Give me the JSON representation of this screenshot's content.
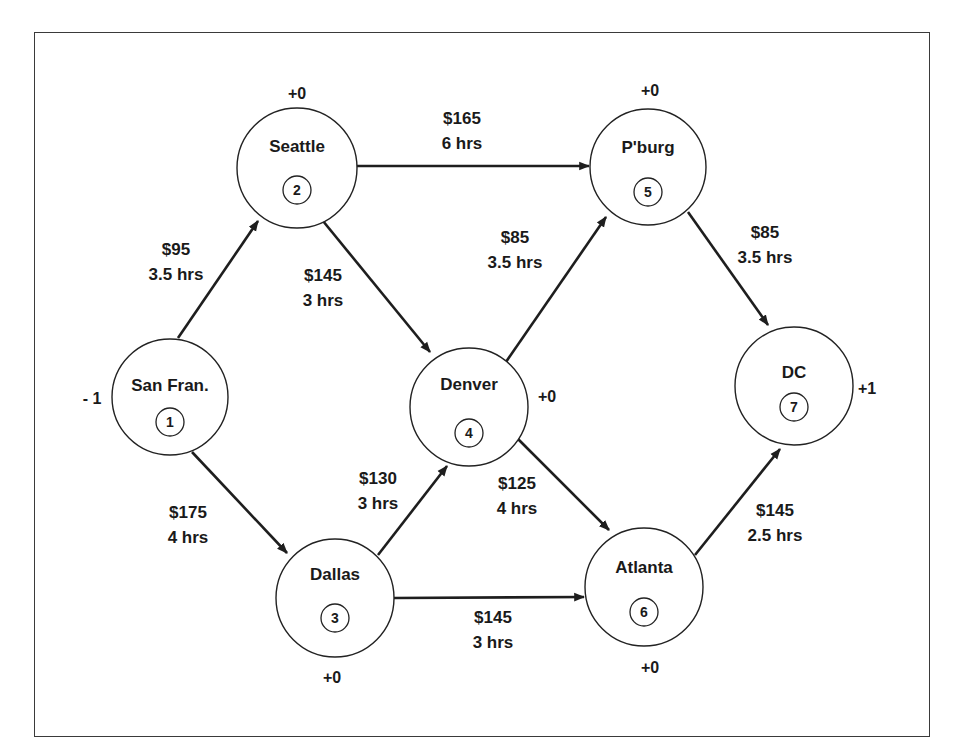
{
  "diagram": {
    "type": "network-flow",
    "nodes": [
      {
        "id": "1",
        "name": "San Fran.",
        "supply": "- 1",
        "cx": 170,
        "cy": 397,
        "r": 58,
        "supply_x": 92,
        "supply_y": 404,
        "name_dy": -12,
        "id_dy": 25
      },
      {
        "id": "2",
        "name": "Seattle",
        "supply": "+0",
        "cx": 297,
        "cy": 168,
        "r": 60,
        "supply_x": 297,
        "supply_y": 99,
        "name_dy": -22,
        "id_dy": 22
      },
      {
        "id": "3",
        "name": "Dallas",
        "supply": "+0",
        "cx": 335,
        "cy": 598,
        "r": 59,
        "supply_x": 332,
        "supply_y": 683,
        "name_dy": -24,
        "id_dy": 20
      },
      {
        "id": "4",
        "name": "Denver",
        "supply": "+0",
        "cx": 469,
        "cy": 407,
        "r": 59,
        "supply_x": 547,
        "supply_y": 402,
        "name_dy": -23,
        "id_dy": 26
      },
      {
        "id": "5",
        "name": "P'burg",
        "supply": "+0",
        "cx": 648,
        "cy": 167,
        "r": 58,
        "supply_x": 650,
        "supply_y": 96,
        "name_dy": -20,
        "id_dy": 25
      },
      {
        "id": "6",
        "name": "Atlanta",
        "supply": "+0",
        "cx": 644,
        "cy": 587,
        "r": 59,
        "supply_x": 650,
        "supply_y": 673,
        "name_dy": -20,
        "id_dy": 25
      },
      {
        "id": "7",
        "name": "DC",
        "supply": "+1",
        "cx": 794,
        "cy": 386,
        "r": 59,
        "supply_x": 867,
        "supply_y": 394,
        "name_dy": -14,
        "id_dy": 21
      }
    ],
    "edges": [
      {
        "from": "1",
        "to": "2",
        "cost": "$95",
        "time": "3.5 hrs",
        "x1": 178,
        "y1": 338,
        "x2": 258,
        "y2": 221,
        "lx": 176,
        "ly": 255
      },
      {
        "from": "1",
        "to": "3",
        "cost": "$175",
        "time": "4 hrs",
        "x1": 192,
        "y1": 452,
        "x2": 287,
        "y2": 553,
        "lx": 188,
        "ly": 518
      },
      {
        "from": "2",
        "to": "4",
        "cost": "$145",
        "time": "3 hrs",
        "x1": 323,
        "y1": 221,
        "x2": 430,
        "y2": 352,
        "lx": 323,
        "ly": 281
      },
      {
        "from": "2",
        "to": "5",
        "cost": "$165",
        "time": "6 hrs",
        "x1": 357,
        "y1": 166,
        "x2": 589,
        "y2": 166,
        "lx": 462,
        "ly": 124
      },
      {
        "from": "3",
        "to": "4",
        "cost": "$130",
        "time": "3 hrs",
        "x1": 378,
        "y1": 555,
        "x2": 447,
        "y2": 466,
        "lx": 378,
        "ly": 484
      },
      {
        "from": "3",
        "to": "6",
        "cost": "$145",
        "time": "3 hrs",
        "x1": 394,
        "y1": 598,
        "x2": 584,
        "y2": 597,
        "lx": 493,
        "ly": 623
      },
      {
        "from": "4",
        "to": "5",
        "cost": "$85",
        "time": "3.5 hrs",
        "x1": 497,
        "y1": 375,
        "x2": 606,
        "y2": 217,
        "lx": 515,
        "ly": 243
      },
      {
        "from": "4",
        "to": "6",
        "cost": "$125",
        "time": "4 hrs",
        "x1": 517,
        "y1": 438,
        "x2": 609,
        "y2": 530,
        "lx": 517,
        "ly": 489
      },
      {
        "from": "5",
        "to": "7",
        "cost": "$85",
        "time": "3.5 hrs",
        "x1": 688,
        "y1": 212,
        "x2": 768,
        "y2": 325,
        "lx": 765,
        "ly": 238
      },
      {
        "from": "6",
        "to": "7",
        "cost": "$145",
        "time": "2.5 hrs",
        "x1": 695,
        "y1": 555,
        "x2": 780,
        "y2": 449,
        "lx": 775,
        "ly": 516
      }
    ]
  },
  "colors": {
    "ink": "#1e1e1e",
    "background": "#ffffff",
    "frame": "#3a3a3a"
  }
}
